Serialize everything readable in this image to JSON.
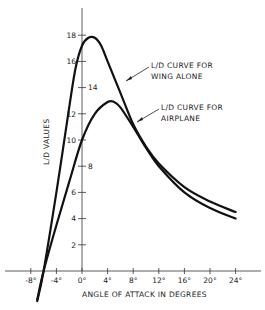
{
  "chart_data": {
    "type": "line",
    "title": "",
    "xlabel": "ANGLE OF ATTACK IN DEGREES",
    "ylabel": "L/D VALUES",
    "xlim": [
      -9,
      28
    ],
    "ylim": [
      -2.5,
      20
    ],
    "grid": false,
    "x_ticks": [
      -8,
      -4,
      0,
      4,
      8,
      12,
      16,
      20,
      24
    ],
    "x_tick_labels": [
      "-8°",
      "-4°",
      "0°",
      "4°",
      "8°",
      "12°",
      "16°",
      "20°",
      "24°"
    ],
    "y_ticks": [
      2,
      4,
      6,
      8,
      10,
      12,
      14,
      16,
      18
    ],
    "y_tick_labels": [
      "2",
      "4",
      "6",
      "8",
      "10",
      "12",
      "14",
      "16",
      "18"
    ],
    "series": [
      {
        "name": "L/D CURVE FOR WING ALONE",
        "x": [
          -7,
          -6,
          -4,
          -2,
          -1,
          0,
          1,
          2,
          3,
          4,
          6,
          8,
          10,
          12,
          16,
          20,
          24
        ],
        "values": [
          -2.3,
          0,
          6,
          12.5,
          15.5,
          17.2,
          17.8,
          17.8,
          17.2,
          16,
          13.6,
          11.2,
          9.5,
          8.2,
          6.4,
          5.3,
          4.5
        ]
      },
      {
        "name": "L/D CURVE FOR AIRPLANE",
        "x": [
          -7,
          -6,
          -4,
          -2,
          0,
          2,
          4,
          5,
          6,
          8,
          10,
          12,
          16,
          20,
          24
        ],
        "values": [
          -2.2,
          0,
          3.5,
          6.8,
          10,
          12,
          12.9,
          12.9,
          12.5,
          11,
          9.4,
          8,
          6,
          4.8,
          4.0
        ]
      }
    ],
    "annotations": [
      {
        "lines": [
          "L/D CURVE FOR",
          "WING ALONE"
        ],
        "points_to": "L/D CURVE FOR WING ALONE"
      },
      {
        "lines": [
          "L/D CURVE FOR",
          "AIRPLANE"
        ],
        "points_to": "L/D CURVE FOR AIRPLANE"
      }
    ],
    "legend": "none (inline annotations with leader lines)"
  },
  "labels": {
    "xlabel": "ANGLE OF ATTACK IN DEGREES",
    "ylabel": "L/D VALUES",
    "wing_line1": "L/D CURVE FOR",
    "wing_line2": "WING ALONE",
    "plane_line1": "L/D CURVE FOR",
    "plane_line2": "AIRPLANE"
  },
  "colors": {
    "ink": "#111111",
    "background": "#ffffff"
  }
}
